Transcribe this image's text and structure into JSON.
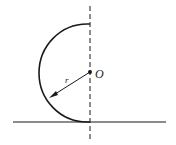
{
  "diagram": {
    "center_label": "O",
    "radius_label": "r",
    "center": {
      "x": 90,
      "y": 72
    },
    "radius": 49,
    "ground_y": 122,
    "stroke_color": "#1a1a1a"
  }
}
